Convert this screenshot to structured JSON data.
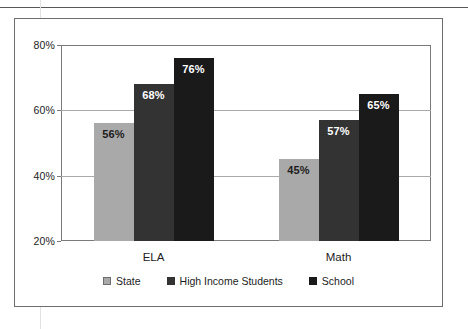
{
  "chart_data": {
    "type": "bar",
    "title": "",
    "subtitle": "",
    "xlabel": "",
    "ylabel": "",
    "categories": [
      "ELA",
      "Math"
    ],
    "series": [
      {
        "name": "State",
        "values": [
          56,
          57
        ],
        "color": "#a9a9a9",
        "label_color": "#1c1c1c"
      },
      {
        "name": "High Income Students",
        "values": [
          68,
          57
        ],
        "color": "#333333",
        "label_color": "#ffffff"
      },
      {
        "name": "School",
        "values": [
          76,
          65
        ],
        "color": "#1a1a1a",
        "label_color": "#ffffff"
      }
    ],
    "bars": [
      {
        "group": "ELA",
        "series": "State",
        "value": 56,
        "label": "56%",
        "color": "#a9a9a9",
        "label_color": "#1c1c1c"
      },
      {
        "group": "ELA",
        "series": "High Income Students",
        "value": 68,
        "label": "68%",
        "color": "#333333",
        "label_color": "#ffffff"
      },
      {
        "group": "ELA",
        "series": "School",
        "value": 76,
        "label": "76%",
        "color": "#1a1a1a",
        "label_color": "#ffffff"
      },
      {
        "group": "Math",
        "series": "State",
        "value": 45,
        "label": "45%",
        "color": "#a9a9a9",
        "label_color": "#1c1c1c"
      },
      {
        "group": "Math",
        "series": "High Income Students",
        "value": 57,
        "label": "57%",
        "color": "#333333",
        "label_color": "#ffffff"
      },
      {
        "group": "Math",
        "series": "School",
        "value": 65,
        "label": "65%",
        "color": "#1a1a1a",
        "label_color": "#ffffff"
      }
    ],
    "ylim": [
      20,
      80
    ],
    "yticks": [
      20,
      40,
      60,
      80
    ],
    "ytick_labels": [
      "20%",
      "40%",
      "60%",
      "80%"
    ],
    "grid": true,
    "grid_axis": "y",
    "legend_position": "bottom",
    "legend": [
      {
        "label": "State",
        "color": "#a9a9a9",
        "border": "#6e6e6e"
      },
      {
        "label": "High Income Students",
        "color": "#333333",
        "border": "#333333"
      },
      {
        "label": "School",
        "color": "#1a1a1a",
        "border": "#1a1a1a"
      }
    ]
  },
  "colors": {
    "frame": "#6e6e6e",
    "plot_border": "#7a7a7a",
    "gridline": "#aaaaaa",
    "background": "#ffffff",
    "text": "#1c1c1c"
  }
}
